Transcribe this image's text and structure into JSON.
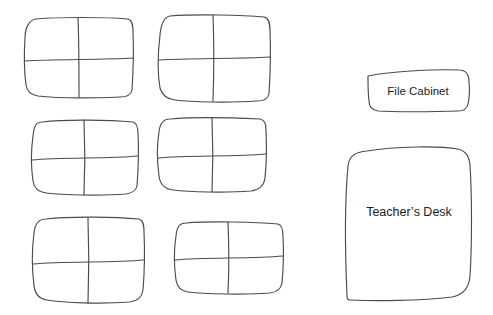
{
  "document": {
    "kind": "classroom-floor-plan",
    "background_color": "#ffffff",
    "stroke_color": "#4a4a50",
    "text_color": "#1d1d20",
    "width": 493,
    "height": 315
  },
  "desk_clusters": {
    "count": 6,
    "seats_per_cluster": 4,
    "label": "",
    "items": [
      {
        "id": "desk-cluster-1",
        "row": 1,
        "column": 1,
        "label": ""
      },
      {
        "id": "desk-cluster-2",
        "row": 1,
        "column": 2,
        "label": ""
      },
      {
        "id": "desk-cluster-3",
        "row": 2,
        "column": 1,
        "label": ""
      },
      {
        "id": "desk-cluster-4",
        "row": 2,
        "column": 2,
        "label": ""
      },
      {
        "id": "desk-cluster-5",
        "row": 3,
        "column": 1,
        "label": ""
      },
      {
        "id": "desk-cluster-6",
        "row": 3,
        "column": 2,
        "label": ""
      }
    ]
  },
  "furniture": {
    "file_cabinet": {
      "label": "File Cabinet"
    },
    "teachers_desk": {
      "label": "Teacher’s Desk"
    }
  }
}
